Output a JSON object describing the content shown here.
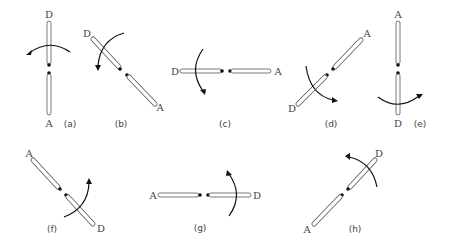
{
  "figure": {
    "panels": [
      {
        "id": "a",
        "caption": "(a)",
        "end_top": "D",
        "end_bottom": "A",
        "orientation": "vertical",
        "rotation_arrow": "counterclockwise-left, above joint"
      },
      {
        "id": "b",
        "caption": "(b)",
        "end_top": "D",
        "end_bottom": "A",
        "orientation": "diagonal top-left to bottom-right",
        "rotation_arrow": "down-left, above joint"
      },
      {
        "id": "c",
        "caption": "(c)",
        "end_left": "D",
        "end_right": "A",
        "orientation": "horizontal",
        "rotation_arrow": "downward, left of joint"
      },
      {
        "id": "d",
        "caption": "(d)",
        "end_top": "A",
        "end_bottom": "D",
        "orientation": "diagonal bottom-left to top-right",
        "rotation_arrow": "down-right, below joint"
      },
      {
        "id": "e",
        "caption": "(e)",
        "end_top": "A",
        "end_bottom": "D",
        "orientation": "vertical",
        "rotation_arrow": "right, below joint"
      },
      {
        "id": "f",
        "caption": "(f)",
        "end_top": "A",
        "end_bottom": "D",
        "orientation": "diagonal top-left to bottom-right",
        "rotation_arrow": "up-right, below joint"
      },
      {
        "id": "g",
        "caption": "(g)",
        "end_left": "A",
        "end_right": "D",
        "orientation": "horizontal",
        "rotation_arrow": "upward, right of joint"
      },
      {
        "id": "h",
        "caption": "(h)",
        "end_top": "D",
        "end_bottom": "A",
        "orientation": "diagonal bottom-left to top-right",
        "rotation_arrow": "up-left, above joint"
      }
    ]
  },
  "labels": {
    "a": {
      "top": "D",
      "bottom": "A",
      "caption": "(a)"
    },
    "b": {
      "top": "D",
      "bottom": "A",
      "caption": "(b)"
    },
    "c": {
      "left": "D",
      "right": "A",
      "caption": "(c)"
    },
    "d": {
      "top": "A",
      "bottom": "D",
      "caption": "(d)"
    },
    "e": {
      "top": "A",
      "bottom": "D",
      "caption": "(e)"
    },
    "f": {
      "top": "A",
      "bottom": "D",
      "caption": "(f)"
    },
    "g": {
      "left": "A",
      "right": "D",
      "caption": "(g)"
    },
    "h": {
      "top": "D",
      "bottom": "A",
      "caption": "(h)"
    }
  },
  "colors": {
    "rod_outline": "#555555",
    "dot": "#111111",
    "arrow": "#111111",
    "text": "#444444",
    "background": "#ffffff"
  }
}
